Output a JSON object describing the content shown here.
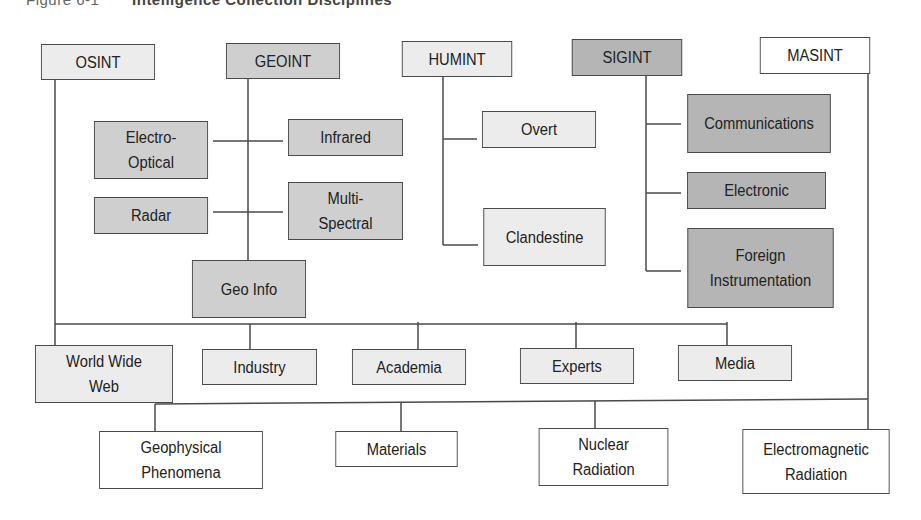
{
  "figure": {
    "caption_prefix": "Figure 6-1",
    "caption_title": "Intelligence Collection Disciplines",
    "colors": {
      "light": "#ececec",
      "mid": "#cfcfcf",
      "dark": "#b5b5b5",
      "white": "#ffffff",
      "line": "#4a4a4a"
    }
  },
  "disciplines": {
    "osint": "OSINT",
    "geoint": "GEOINT",
    "humint": "HUMINT",
    "sigint": "SIGINT",
    "masint": "MASINT"
  },
  "geoint_children": {
    "electro_optical": "Electro-\nOptical",
    "infrared": "Infrared",
    "radar": "Radar",
    "multi_spectral": "Multi-\nSpectral",
    "geo_info": "Geo Info"
  },
  "humint_children": {
    "overt": "Overt",
    "clandestine": "Clandestine"
  },
  "sigint_children": {
    "communications": "Communications",
    "electronic": "Electronic",
    "foreign_instrumentation": "Foreign\nInstrumentation"
  },
  "osint_children": {
    "world_wide_web": "World Wide\nWeb",
    "industry": "Industry",
    "academia": "Academia",
    "experts": "Experts",
    "media": "Media"
  },
  "masint_children": {
    "geophysical_phenomena": "Geophysical\nPhenomena",
    "materials": "Materials",
    "nuclear_radiation": "Nuclear\nRadiation",
    "electromagnetic_radiation": "Electromagnetic\nRadiation"
  }
}
